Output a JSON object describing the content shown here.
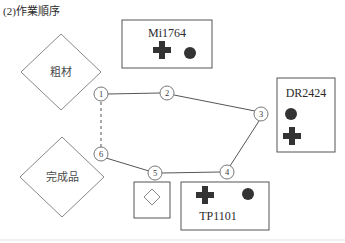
{
  "page": {
    "title": "(2)作業順序"
  },
  "diagram": {
    "type": "process-routing-network",
    "shapes": {
      "raw_material": {
        "label": "粗材",
        "form": "diamond",
        "cx": 61,
        "cy": 72,
        "rx": 40,
        "ry": 38
      },
      "finished_product": {
        "label": "完成品",
        "form": "diamond",
        "cx": 62,
        "cy": 177,
        "rx": 42,
        "ry": 40
      },
      "inspection_box": {
        "label": "",
        "form": "square-with-diamond",
        "x": 134,
        "y": 182,
        "w": 36,
        "h": 36
      }
    },
    "machine_boxes": [
      {
        "id": "mi1764",
        "name": "Mi1764",
        "x": 122,
        "y": 20,
        "w": 90,
        "h": 48,
        "label_position": "top",
        "icons": [
          "cross-icon",
          "circle-icon"
        ],
        "icon_layout": "horizontal"
      },
      {
        "id": "dr2424",
        "name": "DR2424",
        "x": 277,
        "y": 78,
        "w": 58,
        "h": 74,
        "label_position": "top",
        "icons": [
          "circle-icon",
          "cross-icon"
        ],
        "icon_layout": "vertical"
      },
      {
        "id": "tp1101",
        "name": "TP1101",
        "x": 181,
        "y": 182,
        "w": 88,
        "h": 48,
        "label_position": "bottom",
        "icons": [
          "cross-icon",
          "circle-icon"
        ],
        "icon_layout": "horizontal"
      }
    ],
    "nodes": [
      {
        "id": "n1",
        "label": "①",
        "number": 1,
        "x": 101,
        "y": 94
      },
      {
        "id": "n2",
        "label": "②",
        "number": 2,
        "x": 167,
        "y": 93
      },
      {
        "id": "n3",
        "label": "③",
        "number": 3,
        "x": 261,
        "y": 114
      },
      {
        "id": "n4",
        "label": "④",
        "number": 4,
        "x": 227,
        "y": 172
      },
      {
        "id": "n5",
        "label": "⑤",
        "number": 5,
        "x": 155,
        "y": 173
      },
      {
        "id": "n6",
        "label": "⑥",
        "number": 6,
        "x": 101,
        "y": 154
      }
    ],
    "edges": [
      {
        "from": "n1",
        "to": "n2",
        "style": "solid"
      },
      {
        "from": "n2",
        "to": "n3",
        "style": "solid"
      },
      {
        "from": "n3",
        "to": "n4",
        "style": "solid"
      },
      {
        "from": "n4",
        "to": "n5",
        "style": "solid"
      },
      {
        "from": "n5",
        "to": "n6",
        "style": "solid"
      },
      {
        "from": "n6",
        "to": "n1",
        "style": "dashed"
      }
    ],
    "colors": {
      "line": "#555555",
      "shape_outline": "#777777",
      "box_outline": "#555555",
      "icon_fill": "#333333",
      "text": "#2b2b2b"
    }
  }
}
